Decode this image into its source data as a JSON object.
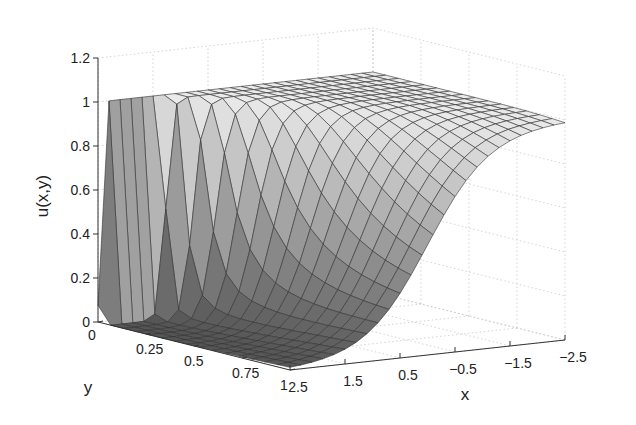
{
  "chart_data": {
    "type": "surface",
    "title": "",
    "xlabel": "x",
    "ylabel": "y",
    "zlabel": "u(x,y)",
    "xlim": [
      -2.5,
      2.5
    ],
    "ylim": [
      0,
      1
    ],
    "zlim": [
      0,
      1.2
    ],
    "x_ticks": [
      "2.5",
      "1.5",
      "0.5",
      "−0.5",
      "−1.5",
      "−2.5"
    ],
    "y_ticks": [
      "0",
      "0.25",
      "0.5",
      "0.75",
      "1"
    ],
    "z_ticks": [
      "0",
      "0.2",
      "0.4",
      "0.6",
      "0.8",
      "1",
      "1.2"
    ],
    "grid": true,
    "legend": null,
    "mesh": {
      "nx": 26,
      "ny": 16
    },
    "sample_profile_y1": {
      "x": [
        2.5,
        1.5,
        0.5,
        -0.5,
        -1.5,
        -2.5
      ],
      "u": [
        0.02,
        0.08,
        0.3,
        0.7,
        0.92,
        0.98
      ]
    },
    "sample_profile_y0": {
      "x": [
        2.5,
        2.4,
        1.5,
        0.5,
        -0.5,
        -1.5,
        -2.5
      ],
      "u": [
        0.0,
        1.0,
        1.0,
        1.0,
        1.0,
        1.0,
        1.0
      ]
    }
  }
}
